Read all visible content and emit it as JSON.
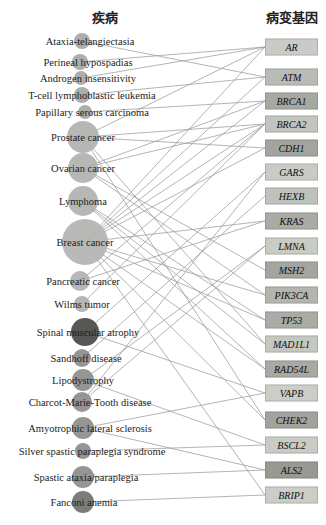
{
  "header": {
    "left_title": "疾病",
    "right_title": "病变基因"
  },
  "network": {
    "type": "bipartite-disease-gene",
    "edge_color": "#9e9e9e",
    "layout": {
      "disease_circle_cx": 82,
      "gene_box_x": 265,
      "gene_box_w": 53,
      "gene_box_h": 17
    },
    "diseases": [
      {
        "label": "Ataxia-telangiectasia",
        "y": 41,
        "r": 8,
        "cx": 82,
        "label_cx": 90,
        "color": "#a9a9a7"
      },
      {
        "label": "Perineal hypospadias",
        "y": 62,
        "r": 8,
        "cx": 80,
        "label_cx": 88,
        "color": "#a9a9a7"
      },
      {
        "label": "Androgen insensitivity",
        "y": 78,
        "r": 7,
        "cx": 81,
        "label_cx": 88,
        "color": "#a9a9a7"
      },
      {
        "label": "T-cell lymphoblastic leukemia",
        "y": 95,
        "r": 8,
        "cx": 82,
        "label_cx": 92,
        "color": "#a9a9a7"
      },
      {
        "label": "Papillary serous carcinoma",
        "y": 112,
        "r": 7,
        "cx": 85,
        "label_cx": 92,
        "color": "#a9a9a7"
      },
      {
        "label": "Prostate cancer",
        "y": 137,
        "r": 16,
        "cx": 83,
        "label_cx": 83,
        "color": "#b3b3b1"
      },
      {
        "label": "Ovarian cancer",
        "y": 168,
        "r": 15,
        "cx": 83,
        "label_cx": 83,
        "color": "#b3b3b1"
      },
      {
        "label": "Lymphoma",
        "y": 201,
        "r": 15,
        "cx": 83,
        "label_cx": 83,
        "color": "#b3b3b1"
      },
      {
        "label": "Breast cancer",
        "y": 242,
        "r": 23,
        "cx": 85,
        "label_cx": 85,
        "color": "#b5b5b3"
      },
      {
        "label": "Pancreatic cancer",
        "y": 281,
        "r": 10,
        "cx": 80,
        "label_cx": 83,
        "color": "#b3b3b1"
      },
      {
        "label": "Wilms tumor",
        "y": 304,
        "r": 8,
        "cx": 82,
        "label_cx": 82,
        "color": "#b3b3b1"
      },
      {
        "label": "Spinal muscular atrophy",
        "y": 332,
        "r": 14,
        "cx": 85,
        "label_cx": 88,
        "color": "#4e4e4c"
      },
      {
        "label": "Sandhoff disease",
        "y": 358,
        "r": 9,
        "cx": 82,
        "label_cx": 86,
        "color": "#8f8f8d"
      },
      {
        "label": "Lipodystrophy",
        "y": 380,
        "r": 11,
        "cx": 83,
        "label_cx": 83,
        "color": "#8f8f8d"
      },
      {
        "label": "Charcot-Marie-Tooth disease",
        "y": 402,
        "r": 10,
        "cx": 82,
        "label_cx": 90,
        "color": "#8f8f8d"
      },
      {
        "label": "Amyotrophic lateral sclerosis",
        "y": 428,
        "r": 11,
        "cx": 83,
        "label_cx": 90,
        "color": "#8f8f8d"
      },
      {
        "label": "Silver spastic paraplegia syndrome",
        "y": 451,
        "r": 8,
        "cx": 83,
        "label_cx": 92,
        "color": "#8f8f8d"
      },
      {
        "label": "Spastic ataxia/paraplegia",
        "y": 477,
        "r": 11,
        "cx": 83,
        "label_cx": 86,
        "color": "#8f8f8d"
      },
      {
        "label": "Fanconi anemia",
        "y": 502,
        "r": 11,
        "cx": 83,
        "label_cx": 84,
        "color": "#757573"
      }
    ],
    "genes": [
      {
        "label": "AR",
        "y": 47,
        "color": "#c9ccc6"
      },
      {
        "label": "ATM",
        "y": 77,
        "color": "#b9bcb6"
      },
      {
        "label": "BRCA1",
        "y": 101,
        "color": "#a6a8a2"
      },
      {
        "label": "BRCA2",
        "y": 124,
        "color": "#c2c4be"
      },
      {
        "label": "CDH1",
        "y": 148,
        "color": "#a2a49e"
      },
      {
        "label": "GARS",
        "y": 172,
        "color": "#c9ccc6"
      },
      {
        "label": "HEXB",
        "y": 196,
        "color": "#bfc1bb"
      },
      {
        "label": "KRAS",
        "y": 221,
        "color": "#a9aba5"
      },
      {
        "label": "LMNA",
        "y": 246,
        "color": "#c9cbc5"
      },
      {
        "label": "MSH2",
        "y": 270,
        "color": "#a3a59f"
      },
      {
        "label": "PIK3CA",
        "y": 295,
        "color": "#b3b5af"
      },
      {
        "label": "TP53",
        "y": 320,
        "color": "#a9aba5"
      },
      {
        "label": "MAD1L1",
        "y": 344,
        "color": "#c5c7c1"
      },
      {
        "label": "RAD54L",
        "y": 369,
        "color": "#a7a9a3"
      },
      {
        "label": "VAPB",
        "y": 393,
        "color": "#cbcdc7"
      },
      {
        "label": "CHEK2",
        "y": 420,
        "color": "#a1a39d"
      },
      {
        "label": "BSCL2",
        "y": 445,
        "color": "#c9cbc5"
      },
      {
        "label": "ALS2",
        "y": 470,
        "color": "#979993"
      },
      {
        "label": "BRIP1",
        "y": 495,
        "color": "#cbcdc7"
      }
    ],
    "edges": [
      [
        "Ataxia-telangiectasia",
        "ATM"
      ],
      [
        "Perineal hypospadias",
        "AR"
      ],
      [
        "Androgen insensitivity",
        "AR"
      ],
      [
        "T-cell lymphoblastic leukemia",
        "ATM"
      ],
      [
        "Papillary serous carcinoma",
        "BRCA1"
      ],
      [
        "Prostate cancer",
        "AR"
      ],
      [
        "Prostate cancer",
        "BRCA2"
      ],
      [
        "Prostate cancer",
        "CDH1"
      ],
      [
        "Prostate cancer",
        "CHEK2"
      ],
      [
        "Prostate cancer",
        "MAD1L1"
      ],
      [
        "Ovarian cancer",
        "BRCA1"
      ],
      [
        "Ovarian cancer",
        "BRCA2"
      ],
      [
        "Ovarian cancer",
        "MSH2"
      ],
      [
        "Ovarian cancer",
        "PIK3CA"
      ],
      [
        "Lymphoma",
        "MAD1L1"
      ],
      [
        "Lymphoma",
        "RAD54L"
      ],
      [
        "Lymphoma",
        "TP53"
      ],
      [
        "Breast cancer",
        "AR"
      ],
      [
        "Breast cancer",
        "ATM"
      ],
      [
        "Breast cancer",
        "BRCA1"
      ],
      [
        "Breast cancer",
        "BRCA2"
      ],
      [
        "Breast cancer",
        "CDH1"
      ],
      [
        "Breast cancer",
        "KRAS"
      ],
      [
        "Breast cancer",
        "PIK3CA"
      ],
      [
        "Breast cancer",
        "TP53"
      ],
      [
        "Breast cancer",
        "RAD54L"
      ],
      [
        "Breast cancer",
        "CHEK2"
      ],
      [
        "Breast cancer",
        "BRIP1"
      ],
      [
        "Pancreatic cancer",
        "BRCA2"
      ],
      [
        "Pancreatic cancer",
        "KRAS"
      ],
      [
        "Wilms tumor",
        "BRCA2"
      ],
      [
        "Spinal muscular atrophy",
        "GARS"
      ],
      [
        "Spinal muscular atrophy",
        "VAPB"
      ],
      [
        "Sandhoff disease",
        "HEXB"
      ],
      [
        "Lipodystrophy",
        "LMNA"
      ],
      [
        "Lipodystrophy",
        "BSCL2"
      ],
      [
        "Charcot-Marie-Tooth disease",
        "GARS"
      ],
      [
        "Charcot-Marie-Tooth disease",
        "LMNA"
      ],
      [
        "Amyotrophic lateral sclerosis",
        "ALS2"
      ],
      [
        "Amyotrophic lateral sclerosis",
        "VAPB"
      ],
      [
        "Silver spastic paraplegia syndrome",
        "BSCL2"
      ],
      [
        "Spastic ataxia/paraplegia",
        "ALS2"
      ],
      [
        "Fanconi anemia",
        "BRIP1"
      ]
    ]
  }
}
